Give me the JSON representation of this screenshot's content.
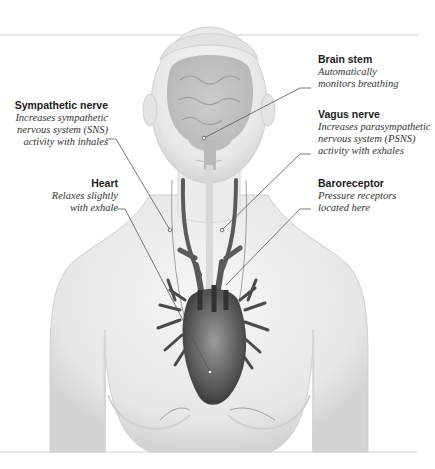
{
  "figure": {
    "labels": [
      {
        "id": "brain-stem",
        "title": "Brain stem",
        "description": "Automatically\nmonitors breathing"
      },
      {
        "id": "sympathetic-nerve",
        "title": "Sympathetic nerve",
        "description": "Increases sympathetic\nnervous system (SNS)\nactivity with inhales"
      },
      {
        "id": "vagus-nerve",
        "title": "Vagus nerve",
        "description": "Increases parasympathetic\nnervous system (PSNS)\nactivity with exhales"
      },
      {
        "id": "heart",
        "title": "Heart",
        "description": "Relaxes slightly\nwith exhale"
      },
      {
        "id": "baroreceptor",
        "title": "Baroreceptor",
        "description": "Pressure receptors\nlocated here"
      }
    ]
  },
  "colors": {
    "background": "#ffffff",
    "body": "#e9e9e9",
    "body_shadow": "#cfcfcf",
    "vessels": "#555555",
    "heart": "#7a7a7a",
    "leader_line": "#555555",
    "rule": "#cccccc"
  }
}
